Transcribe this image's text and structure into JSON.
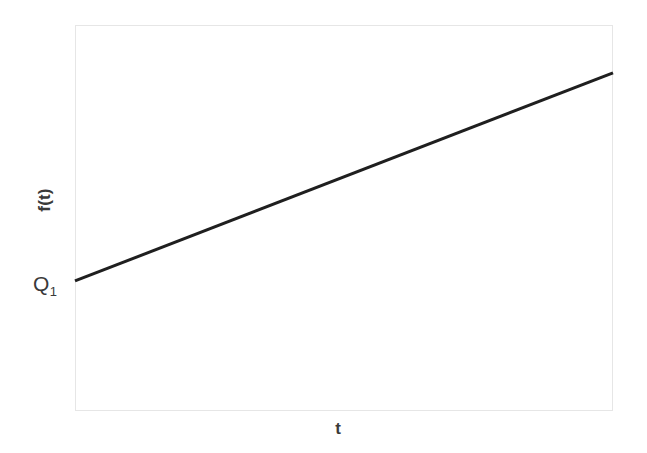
{
  "chart_data": {
    "type": "line",
    "title": "",
    "xlabel": "t",
    "ylabel": "f(t)",
    "grid": false,
    "legend": null,
    "xlim": [
      0,
      1
    ],
    "ylim": [
      0,
      1
    ],
    "axis_ticks": {
      "x": [],
      "y": []
    },
    "series": [
      {
        "name": "f(t)",
        "color": "#1f1f1f",
        "linewidth": 3,
        "x": [
          0,
          1
        ],
        "values": [
          0.337,
          0.876
        ]
      }
    ],
    "annotations": [
      {
        "name": "y-intercept",
        "text": "Q",
        "subscript": "1",
        "x": 0,
        "y": 0.337
      }
    ]
  },
  "labels": {
    "ylabel": "f(t)",
    "xlabel": "t",
    "intercept_base": "Q",
    "intercept_sub": "1"
  },
  "colors": {
    "background": "#ffffff",
    "frame": "#e6e6e6",
    "line": "#1f1f1f",
    "text": "#3a3a3a"
  }
}
